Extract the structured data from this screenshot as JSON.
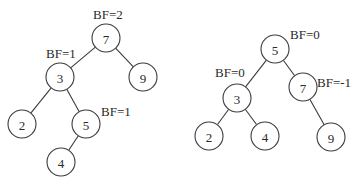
{
  "diagram": {
    "type": "avl-tree-rotation",
    "trees": [
      {
        "name": "before-rotation",
        "nodes": [
          {
            "id": "n7",
            "value": "7",
            "x": 106,
            "y": 38
          },
          {
            "id": "n3",
            "value": "3",
            "x": 60,
            "y": 77
          },
          {
            "id": "n9",
            "value": "9",
            "x": 143,
            "y": 77
          },
          {
            "id": "n2",
            "value": "2",
            "x": 22,
            "y": 124
          },
          {
            "id": "n5",
            "value": "5",
            "x": 86,
            "y": 124
          },
          {
            "id": "n4",
            "value": "4",
            "x": 61,
            "y": 162
          }
        ],
        "edges": [
          [
            "n7",
            "n3"
          ],
          [
            "n7",
            "n9"
          ],
          [
            "n3",
            "n2"
          ],
          [
            "n3",
            "n5"
          ],
          [
            "n5",
            "n4"
          ]
        ],
        "labels": [
          {
            "text": "BF=2",
            "x": 93,
            "y": 19
          },
          {
            "text": "BF=1",
            "x": 46,
            "y": 58
          },
          {
            "text": "BF=1",
            "x": 101,
            "y": 116
          }
        ]
      },
      {
        "name": "after-rotation",
        "nodes": [
          {
            "id": "m5",
            "value": "5",
            "x": 275,
            "y": 49
          },
          {
            "id": "m3",
            "value": "3",
            "x": 237,
            "y": 98
          },
          {
            "id": "m7",
            "value": "7",
            "x": 303,
            "y": 87
          },
          {
            "id": "m2",
            "value": "2",
            "x": 209,
            "y": 136
          },
          {
            "id": "m4",
            "value": "4",
            "x": 265,
            "y": 136
          },
          {
            "id": "m9",
            "value": "9",
            "x": 331,
            "y": 137
          }
        ],
        "edges": [
          [
            "m5",
            "m3"
          ],
          [
            "m5",
            "m7"
          ],
          [
            "m3",
            "m2"
          ],
          [
            "m3",
            "m4"
          ],
          [
            "m7",
            "m9"
          ]
        ],
        "labels": [
          {
            "text": "BF=0",
            "x": 290,
            "y": 39
          },
          {
            "text": "BF=0",
            "x": 215,
            "y": 77
          },
          {
            "text": "BF=-1",
            "x": 317,
            "y": 87
          }
        ]
      }
    ],
    "node_radius": 14,
    "colors": {
      "stroke": "#3a3a3a",
      "text": "#2a2a2a",
      "background": "#ffffff"
    }
  }
}
